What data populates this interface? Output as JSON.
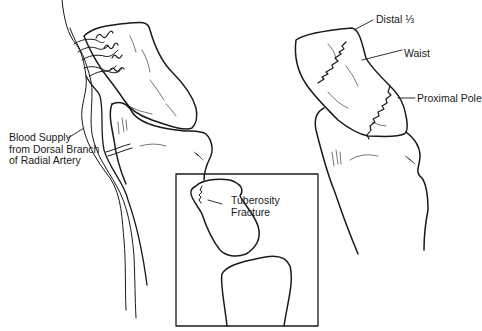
{
  "figure": {
    "panels": {
      "left": {
        "label_lines": [
          "Blood Supply",
          "from Dorsal Branch",
          "of Radial Artery"
        ]
      },
      "right": {
        "labels": {
          "distal": "Distal ⅓",
          "waist": "Waist",
          "proximal": "Proximal Pole"
        }
      },
      "inset": {
        "label_lines": [
          "Tuberosity",
          "Fracture"
        ]
      }
    },
    "colors": {
      "line": "#1a1a1a",
      "background": "#ffffff"
    }
  }
}
